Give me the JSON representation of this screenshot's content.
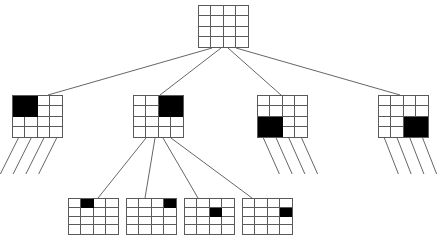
{
  "diagram": {
    "type": "tree",
    "grid_size": 4,
    "cell_on_color": "#000000",
    "cell_off_color": "#ffffff",
    "line_color": "#5a5a5a",
    "edge_color": "#555555",
    "nodes": [
      {
        "id": "root",
        "level": 1,
        "label": "root",
        "x": 198,
        "y": 5,
        "w": 51,
        "h": 43,
        "rows": 4,
        "cols": 4,
        "filled_cells": [],
        "stub_legs": 0
      },
      {
        "id": "n1",
        "level": 2,
        "label": "child-1",
        "x": 12,
        "y": 95,
        "w": 51,
        "h": 43,
        "rows": 4,
        "cols": 4,
        "filled_cells": [
          [
            0,
            0
          ],
          [
            0,
            1
          ],
          [
            1,
            0
          ],
          [
            1,
            1
          ]
        ],
        "stub_legs": 4,
        "stub_dx": -18,
        "stub_len": 36
      },
      {
        "id": "n2",
        "level": 2,
        "label": "child-2",
        "x": 133,
        "y": 95,
        "w": 51,
        "h": 43,
        "rows": 4,
        "cols": 4,
        "filled_cells": [
          [
            0,
            2
          ],
          [
            0,
            3
          ],
          [
            1,
            2
          ],
          [
            1,
            3
          ]
        ],
        "stub_legs": 0
      },
      {
        "id": "n3",
        "level": 2,
        "label": "child-3",
        "x": 257,
        "y": 95,
        "w": 51,
        "h": 43,
        "rows": 4,
        "cols": 4,
        "filled_cells": [
          [
            2,
            0
          ],
          [
            2,
            1
          ],
          [
            3,
            0
          ],
          [
            3,
            1
          ]
        ],
        "stub_legs": 4,
        "stub_dx": 16,
        "stub_len": 36
      },
      {
        "id": "n4",
        "level": 2,
        "label": "child-4",
        "x": 378,
        "y": 95,
        "w": 51,
        "h": 43,
        "rows": 4,
        "cols": 4,
        "filled_cells": [
          [
            2,
            2
          ],
          [
            2,
            3
          ],
          [
            3,
            2
          ],
          [
            3,
            3
          ]
        ],
        "stub_legs": 4,
        "stub_dx": 14,
        "stub_len": 36
      },
      {
        "id": "n2a",
        "level": 3,
        "label": "grandchild-1",
        "x": 68,
        "y": 198,
        "w": 51,
        "h": 37,
        "rows": 4,
        "cols": 4,
        "filled_cells": [
          [
            0,
            1
          ]
        ],
        "stub_legs": 0
      },
      {
        "id": "n2b",
        "level": 3,
        "label": "grandchild-2",
        "x": 126,
        "y": 198,
        "w": 51,
        "h": 37,
        "rows": 4,
        "cols": 4,
        "filled_cells": [
          [
            0,
            3
          ]
        ],
        "stub_legs": 0
      },
      {
        "id": "n2c",
        "level": 3,
        "label": "grandchild-3",
        "x": 184,
        "y": 198,
        "w": 51,
        "h": 37,
        "rows": 4,
        "cols": 4,
        "filled_cells": [
          [
            1,
            2
          ]
        ],
        "stub_legs": 0
      },
      {
        "id": "n2d",
        "level": 3,
        "label": "grandchild-4",
        "x": 242,
        "y": 198,
        "w": 51,
        "h": 37,
        "rows": 4,
        "cols": 4,
        "filled_cells": [
          [
            1,
            3
          ]
        ],
        "stub_legs": 0
      }
    ],
    "edges": [
      {
        "from": "root",
        "to": "n1",
        "x1": 212,
        "y1": 48,
        "x2": 48,
        "y2": 95
      },
      {
        "from": "root",
        "to": "n2",
        "x1": 221,
        "y1": 48,
        "x2": 160,
        "y2": 95
      },
      {
        "from": "root",
        "to": "n3",
        "x1": 228,
        "y1": 48,
        "x2": 281,
        "y2": 95
      },
      {
        "from": "root",
        "to": "n4",
        "x1": 236,
        "y1": 48,
        "x2": 400,
        "y2": 95
      },
      {
        "from": "n2",
        "to": "n2a",
        "x1": 146,
        "y1": 138,
        "x2": 98,
        "y2": 198
      },
      {
        "from": "n2",
        "to": "n2b",
        "x1": 155,
        "y1": 138,
        "x2": 145,
        "y2": 198
      },
      {
        "from": "n2",
        "to": "n2c",
        "x1": 163,
        "y1": 138,
        "x2": 198,
        "y2": 198
      },
      {
        "from": "n2",
        "to": "n2d",
        "x1": 171,
        "y1": 138,
        "x2": 252,
        "y2": 198
      }
    ]
  }
}
